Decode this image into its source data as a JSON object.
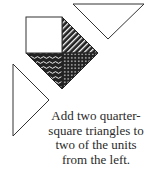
{
  "colors": {
    "stroke": "#333333",
    "fill_dark": "#222222",
    "fill_light": "#ffffff"
  },
  "diagram": {
    "white_square": {
      "x": 26,
      "y": 17,
      "size": 36
    },
    "striped_triangle": {
      "points": "62,17 98,53 62,53",
      "pattern": "diagonal-stripes"
    },
    "dotted_triangle": {
      "points": "62,53 98,53 62,89",
      "pattern": "dots"
    },
    "wavy_triangle": {
      "points": "26,53 62,53 62,89",
      "pattern": "waves"
    },
    "top_triangle": {
      "points": "73,4 144,4 108,39"
    },
    "left_triangle": {
      "points": "13,64 13,136 49,100"
    }
  },
  "caption": {
    "lines": [
      "Add two quarter-",
      "square triangles to",
      "two of the units",
      "from the left."
    ]
  }
}
